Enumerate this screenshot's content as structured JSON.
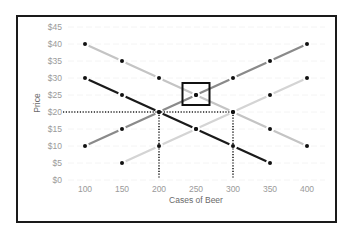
{
  "chart_data": {
    "type": "line",
    "title": "",
    "xlabel": "Cases of Beer",
    "ylabel": "Price",
    "x": [
      100,
      150,
      200,
      250,
      300,
      350,
      400
    ],
    "x_tick_labels": [
      "100",
      "150",
      "200",
      "250",
      "300",
      "350",
      "400"
    ],
    "y_tick_labels": [
      "$0",
      "$5",
      "$10",
      "$15",
      "$20",
      "$25",
      "$30",
      "$35",
      "$40",
      "$45"
    ],
    "xlim": [
      100,
      400
    ],
    "ylim": [
      0,
      45
    ],
    "grid": true,
    "legend": "none",
    "series": [
      {
        "name": "Demand 1",
        "color": "#c4c4c4",
        "x": [
          100,
          150,
          200,
          250,
          300,
          350,
          400
        ],
        "values": [
          40,
          35,
          30,
          25,
          20,
          15,
          10
        ]
      },
      {
        "name": "Demand 2",
        "color": "#1a1a1a",
        "x": [
          100,
          150,
          200,
          250,
          300,
          350
        ],
        "values": [
          30,
          25,
          20,
          15,
          10,
          5
        ]
      },
      {
        "name": "Supply 1",
        "color": "#8a8a8a",
        "x": [
          100,
          150,
          200,
          250,
          300,
          350,
          400
        ],
        "values": [
          10,
          15,
          20,
          25,
          30,
          35,
          40
        ]
      },
      {
        "name": "Supply 2",
        "color": "#d4d4d4",
        "x": [
          150,
          200,
          250,
          300,
          350,
          400
        ],
        "values": [
          5,
          10,
          15,
          20,
          25,
          30
        ]
      }
    ],
    "annotations": [
      {
        "type": "dotted-hline",
        "y": 20,
        "x_from": "axis",
        "x_to": 300,
        "label": ""
      },
      {
        "type": "dotted-vline",
        "x": 200,
        "y_from": 0,
        "y_to": 20,
        "label": ""
      },
      {
        "type": "dotted-vline",
        "x": 300,
        "y_from": 0,
        "y_to": 20,
        "label": ""
      },
      {
        "type": "highlight-box",
        "x": 250,
        "y": 25,
        "label": ""
      }
    ]
  }
}
